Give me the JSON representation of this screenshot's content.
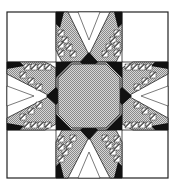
{
  "figure": {
    "colors": {
      "background": "#ffffff",
      "outline": "#222222",
      "black": "#111111",
      "checker_light": "#d8d8d8",
      "checker_dark": "#8a8a8a"
    },
    "grid": {
      "cols": [
        7,
        56,
        122,
        168
      ],
      "rows": [
        12,
        62,
        130,
        178
      ]
    },
    "center": {
      "x": 89,
      "y": 96
    },
    "star_points": 8
  }
}
